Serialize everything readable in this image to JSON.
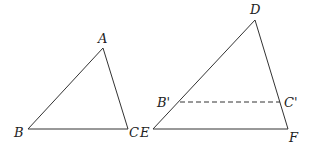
{
  "diagram": {
    "stroke_color": "#333333",
    "triangle_abc": {
      "vertices": {
        "A": {
          "label": "A",
          "x": 103,
          "y": 48,
          "label_x": 98,
          "label_y": 43
        },
        "B": {
          "label": "B",
          "x": 28,
          "y": 129,
          "label_x": 14,
          "label_y": 137
        },
        "C": {
          "label": "C",
          "x": 128,
          "y": 129,
          "label_x": 129,
          "label_y": 137
        }
      },
      "edges": [
        [
          "A",
          "B"
        ],
        [
          "B",
          "C"
        ],
        [
          "C",
          "A"
        ]
      ]
    },
    "triangle_def": {
      "vertices": {
        "D": {
          "label": "D",
          "x": 255,
          "y": 20,
          "label_x": 250,
          "label_y": 14
        },
        "E": {
          "label": "E",
          "x": 153,
          "y": 129,
          "label_x": 140,
          "label_y": 137
        },
        "F": {
          "label": "F",
          "x": 288,
          "y": 129,
          "label_x": 289,
          "label_y": 142
        }
      },
      "edges": [
        [
          "D",
          "E"
        ],
        [
          "E",
          "F"
        ],
        [
          "F",
          "D"
        ]
      ]
    },
    "dashed_segment": {
      "from": {
        "label": "B'",
        "x": 180,
        "y": 102,
        "label_x": 157,
        "label_y": 107
      },
      "to": {
        "label": "C'",
        "x": 280,
        "y": 102,
        "label_x": 284,
        "label_y": 107
      },
      "style": "dashed"
    }
  }
}
